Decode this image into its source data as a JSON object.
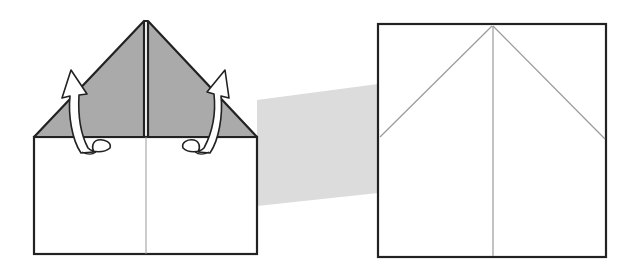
{
  "diagram": {
    "title": "",
    "type": "origami-fold-step",
    "colors": {
      "background": "#ffffff",
      "outline": "#222222",
      "flap_fill": "#aaaaaa",
      "crease": "#9a9a9a",
      "connector_band": "#dcdcdc",
      "arrow_fill": "#ffffff"
    },
    "left_figure": {
      "label": "folded paper with two triangular flaps",
      "flaps": [
        {
          "name": "left-flap",
          "state": "folded down, to unfold upward"
        },
        {
          "name": "right-flap",
          "state": "folded down, to unfold upward"
        }
      ],
      "arrows": [
        {
          "name": "unfold-arrow-left",
          "direction": "up"
        },
        {
          "name": "unfold-arrow-right",
          "direction": "up"
        }
      ]
    },
    "right_figure": {
      "label": "unfolded square showing crease lines",
      "creases": [
        "left-diagonal",
        "center-vertical",
        "right-diagonal"
      ]
    }
  }
}
